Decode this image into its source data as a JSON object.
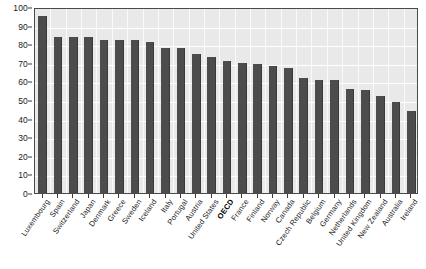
{
  "chart_data": {
    "type": "bar",
    "title": "",
    "subtitle": "",
    "xlabel": "",
    "ylabel": "",
    "ylim": [
      0,
      100
    ],
    "yticks": [
      0,
      10,
      20,
      30,
      40,
      50,
      60,
      70,
      80,
      90,
      100
    ],
    "grid": "horizontal-and-vertical-white",
    "legend": "none",
    "bar_color": "#4c4c4c",
    "plot_background": "#e9e9e9",
    "gridline_color": "#ffffff",
    "axis_color": "#4a4a4a",
    "highlight_category": "OECD",
    "categories": [
      "Luxembourg",
      "Spain",
      "Switzerland",
      "Japan",
      "Denmark",
      "Greece",
      "Sweden",
      "Iceland",
      "Italy",
      "Portugal",
      "Austria",
      "United States",
      "OECD",
      "France",
      "Finland",
      "Norway",
      "Canada",
      "Czech Republic",
      "Belgium",
      "Germany",
      "Netherlands",
      "United Kingdom",
      "New Zealand",
      "Australia",
      "Ireland"
    ],
    "values": [
      95,
      84,
      84,
      84,
      82,
      82,
      82,
      81,
      78,
      78,
      75,
      73,
      71,
      70,
      69.5,
      68.5,
      67,
      62,
      61,
      61,
      56,
      55.5,
      52,
      49,
      44
    ]
  }
}
